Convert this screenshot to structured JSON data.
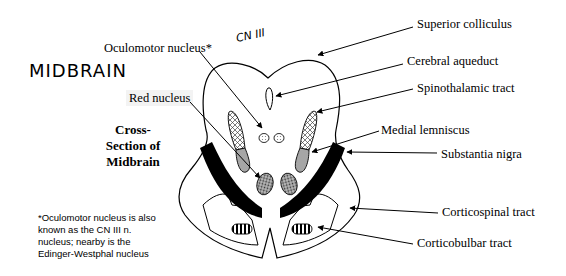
{
  "title": "MIDBRAIN",
  "handwritten_note": "CN III",
  "subtitle": {
    "line1": "Cross-",
    "line2": "Section of",
    "line3": "Midbrain"
  },
  "footnote": {
    "line1": "*Oculomotor nucleus is also",
    "line2": "known as the CN III n.",
    "line3": "nucleus; nearby is the",
    "line4": "Edinger-Westphal  nucleus"
  },
  "labels": {
    "oculomotor_nucleus": "Oculomotor nucleus*",
    "red_nucleus": "Red nucleus",
    "superior_colliculus": "Superior colliculus",
    "cerebral_aqueduct": "Cerebral aqueduct",
    "spinothalamic_tract": "Spinothalamic tract",
    "medial_lemniscus": "Medial lemniscus",
    "substantia_nigra": "Substantia nigra",
    "corticospinal_tract": "Corticospinal tract",
    "corticobulbar_tract": "Corticobulbar tract"
  },
  "colors": {
    "outline": "#000000",
    "substantia_nigra": "#000000",
    "medial_lemniscus": "#a6a6a6",
    "red_nucleus": "#6a6a6a",
    "background": "#ffffff"
  }
}
